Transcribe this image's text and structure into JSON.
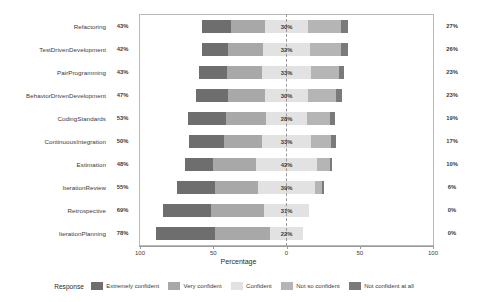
{
  "chart_data": {
    "type": "bar",
    "subtype": "diverging-stacked-likert",
    "title": "",
    "xlabel": "Percentage",
    "ylabel": "",
    "xlim": [
      -100,
      100
    ],
    "xticks": [
      "100",
      "50",
      "0",
      "50",
      "100"
    ],
    "xtick_values": [
      -100,
      -50,
      0,
      50,
      100
    ],
    "grid": false,
    "legend_position": "bottom",
    "legend_title": "Response",
    "categories": [
      "Refactoring",
      "TestDrivenDevelopment",
      "PairProgramming",
      "BehaviorDrivenDevelopment",
      "CodingStandards",
      "ContinuousIntegration",
      "Estimation",
      "IterationReview",
      "Retrospective",
      "IterationPlanning"
    ],
    "series": [
      {
        "name": "Extremely confident",
        "color": "#6e6e6e",
        "values": [
          20,
          18,
          19,
          22,
          26,
          24,
          19,
          26,
          33,
          40
        ]
      },
      {
        "name": "Very confident",
        "color": "#a8a8a8",
        "values": [
          23,
          24,
          24,
          25,
          27,
          26,
          29,
          29,
          36,
          38
        ]
      },
      {
        "name": "Confident",
        "color": "#e2e2e2",
        "values": [
          30,
          32,
          33,
          30,
          28,
          33,
          42,
          39,
          31,
          22
        ]
      },
      {
        "name": "Not so confident",
        "color": "#b5b5b5",
        "values": [
          22,
          21,
          19,
          19,
          16,
          14,
          9,
          5,
          0,
          0
        ]
      },
      {
        "name": "Not confident at all",
        "color": "#7a7a7a",
        "values": [
          5,
          5,
          4,
          4,
          3,
          3,
          1,
          1,
          0,
          0
        ]
      }
    ],
    "left_totals": [
      "43%",
      "42%",
      "43%",
      "47%",
      "53%",
      "50%",
      "48%",
      "55%",
      "69%",
      "78%"
    ],
    "center_totals": [
      "30%",
      "32%",
      "33%",
      "30%",
      "28%",
      "33%",
      "42%",
      "39%",
      "31%",
      "22%"
    ],
    "right_totals": [
      "27%",
      "26%",
      "23%",
      "23%",
      "19%",
      "17%",
      "10%",
      "6%",
      "0%",
      "0%"
    ]
  },
  "axis": {
    "xlabel": "Percentage"
  },
  "legend": {
    "title": "Response",
    "items": [
      {
        "label": "Extremely confident",
        "color": "#6e6e6e"
      },
      {
        "label": "Very confident",
        "color": "#a8a8a8"
      },
      {
        "label": "Confident",
        "color": "#e2e2e2"
      },
      {
        "label": "Not so confident",
        "color": "#b5b5b5"
      },
      {
        "label": "Not confident at all",
        "color": "#7a7a7a"
      }
    ]
  }
}
